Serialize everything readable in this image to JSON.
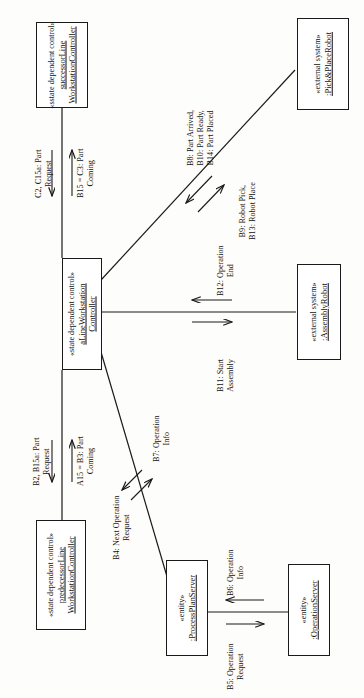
{
  "diagram": {
    "rotation": "90deg-counterclockwise",
    "nodes": [
      {
        "id": "successor-line-workstation-controller",
        "stereotype": "«sstate dependent control»",
        "name_line1": "successorLine",
        "name_line2": "WorkstationController"
      },
      {
        "id": "pick-and-place-robot",
        "stereotype": "«external system»",
        "name_line1": ":Pick&PlaceRobot",
        "name_line2": ""
      },
      {
        "id": "a-line-workstation-controller",
        "stereotype": "«state dependent control»",
        "name_line1": "aLineWorkstation",
        "name_line2": "Controller"
      },
      {
        "id": "assembly-robot",
        "stereotype": "«external system»",
        "name_line1": ":AssemblyRobot",
        "name_line2": ""
      },
      {
        "id": "predecessor-line-workstation-controller",
        "stereotype": "«state dependent control»",
        "name_line1": "predecessorLine",
        "name_line2": "WorkstationController"
      },
      {
        "id": "process-plan-server",
        "stereotype": "«entity»",
        "name_line1": ":ProcessPlanServer",
        "name_line2": ""
      },
      {
        "id": "operation-server",
        "stereotype": "«entity»",
        "name_line1": ":OperationServer",
        "name_line2": ""
      }
    ],
    "messages": [
      {
        "id": "c2-c15a-part-request",
        "line1": "C2, C15a: Part",
        "line2": "Request"
      },
      {
        "id": "b15-c3-part-coming",
        "line1": "B15 = C3: Part",
        "line2": "Coming"
      },
      {
        "id": "b8-b10-b14",
        "line1": "B8: Part Arrived,",
        "line2": "B10: Part Ready,",
        "line3": "B14: Part Placed"
      },
      {
        "id": "b9-b13-robot",
        "line1": "B9: Robot Pick,",
        "line2": "B13: Robot Place"
      },
      {
        "id": "b12-operation-end",
        "line1": "B12: Operation",
        "line2": "End"
      },
      {
        "id": "b11-start-assembly",
        "line1": "B11: Start",
        "line2": "Assembly"
      },
      {
        "id": "b2-b15a-part-request",
        "line1": "B2, B15a: Part",
        "line2": "Request"
      },
      {
        "id": "a15-b3-part-coming",
        "line1": "A15 = B3: Part",
        "line2": "Coming"
      },
      {
        "id": "b7-operation-info",
        "line1": "B7: Operation",
        "line2": "Info"
      },
      {
        "id": "b4-next-operation-request",
        "line1": "B4: Next Operation",
        "line2": "Request"
      },
      {
        "id": "b6-operation-info",
        "line1": "B6: Operation",
        "line2": "Info"
      },
      {
        "id": "b5-operation-request",
        "line1": "B5: Operation",
        "line2": "Request"
      }
    ]
  }
}
